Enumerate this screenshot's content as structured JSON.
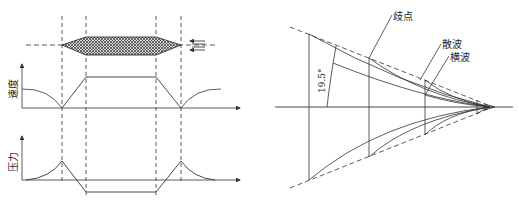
{
  "left_diagram": {
    "velocity_axis_label": "速度",
    "pressure_axis_label": "压力",
    "projectile": "cross-hatched double-cone body",
    "icons": [
      "flow-arrows-icon"
    ]
  },
  "right_diagram": {
    "angle_label": "19.5°",
    "labels": {
      "bifurcation_point": "歧点",
      "scattered_wave": "散波",
      "transverse_wave": "横波"
    }
  },
  "colors": {
    "line": "#333333",
    "background": "#ffffff"
  }
}
